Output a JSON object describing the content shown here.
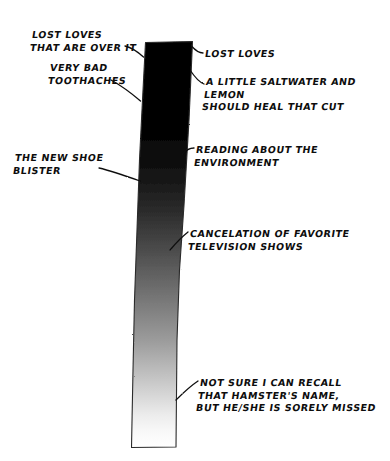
{
  "diagram": {
    "background_color": "#ffffff",
    "ink_color": "#0d0d0d",
    "bar": {
      "name": "gradient-bar",
      "description": "Vertical hand-drawn bar, solid black at top fading to white at bottom",
      "top_color": "#000000",
      "bottom_color": "#ffffff",
      "orientation": "vertical"
    },
    "labels": {
      "lost_loves_over_it": "Lost loves\nthat are over it",
      "very_bad_toothaches": "Very bad\ntoothaches",
      "new_shoe_blister": "The new shoe\nblister",
      "lost_loves": "Lost loves",
      "saltwater_lemon": "A little saltwater and lemon\nshould heal that cut",
      "reading_environment": "Reading about the environment",
      "cancelation_tv": "Cancelation of favorite\ntelevision shows",
      "hamster": "Not sure I can recall\nthat hamster's name,\nbut he/she is sorely missed"
    }
  }
}
